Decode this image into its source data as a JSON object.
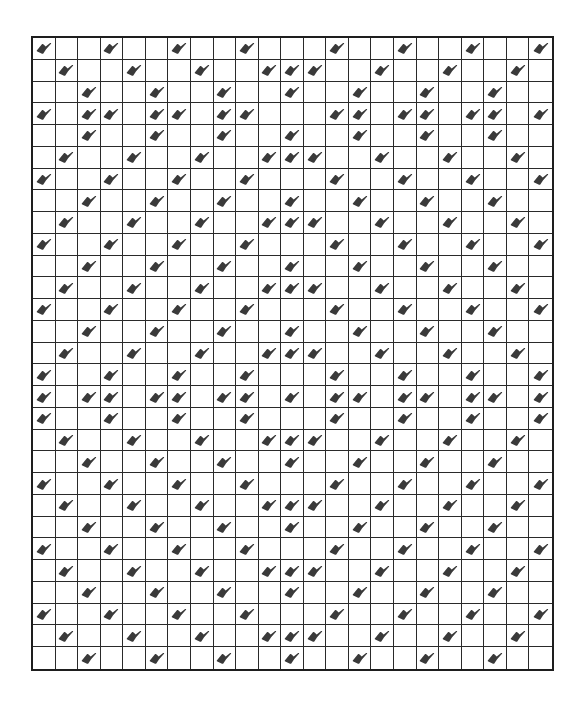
{
  "pattern": {
    "rows": 29,
    "cols": 23,
    "mark_color": "#3a3a3a",
    "line_color": "#2a2a2a",
    "border_color": "#1e1e1e",
    "background": "#ffffff",
    "mark_icon": "checkmark-blob-icon",
    "row_types": {
      "A": [
        0,
        3,
        6,
        9,
        13,
        16,
        19,
        22
      ],
      "B": [
        1,
        4,
        7,
        10,
        11,
        12,
        15,
        18,
        21
      ],
      "C": [
        2,
        5,
        8,
        11,
        14,
        17,
        20
      ],
      "D": [
        0,
        2,
        3,
        5,
        6,
        8,
        9,
        13,
        14,
        16,
        17,
        19,
        20,
        22
      ],
      "E": [
        0,
        2,
        3,
        5,
        6,
        8,
        9,
        11,
        13,
        14,
        16,
        17,
        19,
        20,
        22
      ]
    },
    "row_sequence": [
      "A",
      "B",
      "C",
      "D",
      "C",
      "B",
      "A",
      "C",
      "B",
      "A",
      "C",
      "B",
      "A",
      "C",
      "B",
      "A",
      "E",
      "A",
      "B",
      "C",
      "A",
      "B",
      "C",
      "A",
      "B",
      "C",
      "A",
      "B",
      "C"
    ]
  }
}
